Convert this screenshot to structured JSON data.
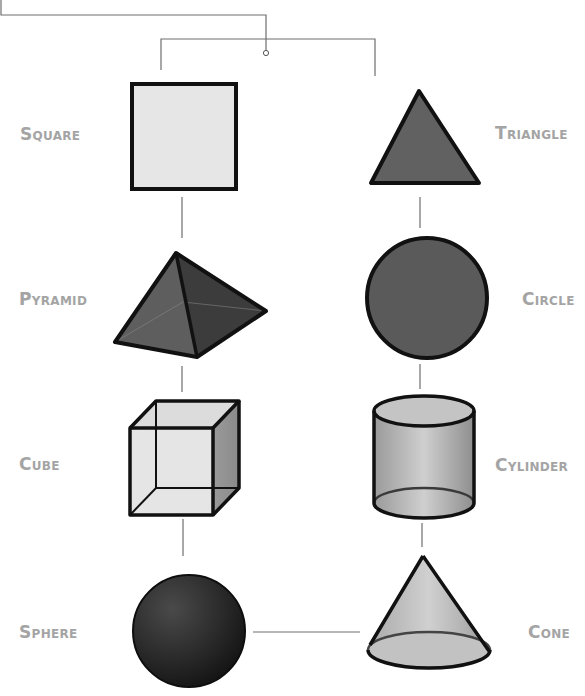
{
  "diagram": {
    "type": "shape-relationship-tree",
    "colors": {
      "label": "#a4a4a4",
      "connector": "#6e6e6e",
      "outline": "#111111",
      "square_fill": "#e6e6e6",
      "triangle_fill": "#616161",
      "pyramid_fill": "#555555",
      "circle_fill": "#5a5a5a",
      "cube_fill": "#e0e0e0",
      "cylinder_fill": "#bdbdbd",
      "sphere_fill": "#2c2c2c",
      "cone_fill": "#bebebe"
    },
    "left_column": [
      {
        "id": "square",
        "label": "Square"
      },
      {
        "id": "pyramid",
        "label": "Pyramid"
      },
      {
        "id": "cube",
        "label": "Cube"
      },
      {
        "id": "sphere",
        "label": "Sphere"
      }
    ],
    "right_column": [
      {
        "id": "triangle",
        "label": "Triangle"
      },
      {
        "id": "circle",
        "label": "Circle"
      },
      {
        "id": "cylinder",
        "label": "Cylinder"
      },
      {
        "id": "cone",
        "label": "Cone"
      }
    ],
    "links": [
      [
        "root",
        "square"
      ],
      [
        "root",
        "triangle"
      ],
      [
        "square",
        "pyramid"
      ],
      [
        "pyramid",
        "cube"
      ],
      [
        "cube",
        "sphere"
      ],
      [
        "triangle",
        "circle"
      ],
      [
        "circle",
        "cylinder"
      ],
      [
        "cylinder",
        "cone"
      ],
      [
        "sphere",
        "cone"
      ]
    ]
  }
}
